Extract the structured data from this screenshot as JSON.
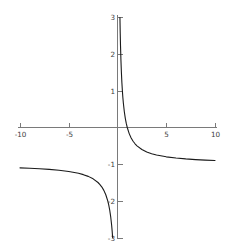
{
  "figure": {
    "name": "rational-function-plot",
    "width": 243,
    "height": 246,
    "background_color": "#ffffff",
    "axis_color": "#7a7a7a",
    "curve_color": "#1a1a1a",
    "tick_label_color": "#3d3d3d"
  },
  "chart_data": {
    "type": "line",
    "title": "",
    "subtitle": "",
    "xlabel": "",
    "ylabel": "",
    "xlim": [
      -10,
      10
    ],
    "ylim": [
      -3,
      3
    ],
    "grid": false,
    "legend": "none",
    "function": "y = 1/x - 1",
    "vertical_asymptote": 0,
    "horizontal_asymptote": -1,
    "x_root": 1,
    "xticks": [
      -10,
      -5,
      5,
      10
    ],
    "xtick_labels": [
      "-10",
      "-5",
      "5",
      "10"
    ],
    "yticks": [
      3,
      2,
      1,
      -1,
      -2,
      -3
    ],
    "ytick_labels": [
      "3",
      "2",
      "1",
      "-1",
      "-2",
      "-3"
    ],
    "series": [
      {
        "name": "branch-right",
        "x": [
          0.25,
          0.28,
          0.31,
          0.35,
          0.4,
          0.45,
          0.5,
          0.55,
          0.6,
          0.7,
          0.8,
          0.9,
          1.0,
          1.2,
          1.4,
          1.6,
          1.8,
          2.0,
          2.5,
          3.0,
          3.5,
          4.0,
          5.0,
          6.0,
          7.0,
          8.0,
          9.0,
          10.0
        ],
        "y": [
          3.0,
          2.571,
          2.226,
          1.857,
          1.5,
          1.222,
          1.0,
          0.818,
          0.667,
          0.429,
          0.25,
          0.111,
          0.0,
          -0.167,
          -0.286,
          -0.375,
          -0.444,
          -0.5,
          -0.6,
          -0.667,
          -0.714,
          -0.75,
          -0.8,
          -0.833,
          -0.857,
          -0.875,
          -0.889,
          -0.9
        ]
      },
      {
        "name": "branch-left",
        "x": [
          -10.0,
          -9.0,
          -8.0,
          -7.0,
          -6.0,
          -5.0,
          -4.0,
          -3.5,
          -3.0,
          -2.5,
          -2.0,
          -1.8,
          -1.6,
          -1.4,
          -1.2,
          -1.0,
          -0.9,
          -0.8,
          -0.7,
          -0.6,
          -0.55,
          -0.5
        ],
        "y": [
          -1.1,
          -1.111,
          -1.125,
          -1.143,
          -1.167,
          -1.2,
          -1.25,
          -1.286,
          -1.333,
          -1.4,
          -1.5,
          -1.556,
          -1.625,
          -1.714,
          -1.833,
          -2.0,
          -2.111,
          -2.25,
          -2.429,
          -2.667,
          -2.818,
          -3.0
        ]
      }
    ]
  }
}
